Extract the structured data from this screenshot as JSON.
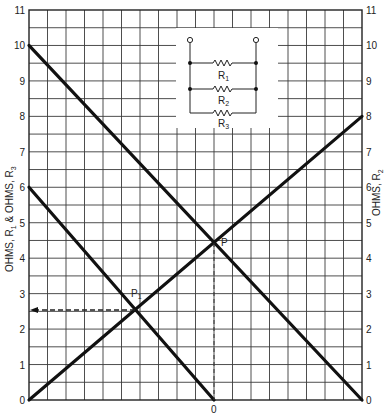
{
  "chart_data": {
    "type": "line",
    "title": "",
    "xlabel": "",
    "ylabel_left": "OHMS, R1 & OHMS, R3",
    "ylabel_right": "OHMS, R2",
    "left_axis": {
      "min": 0,
      "max": 11,
      "ticks": [
        0,
        1,
        2,
        3,
        4,
        5,
        6,
        7,
        8,
        9,
        10,
        11
      ]
    },
    "right_axis": {
      "min": 0,
      "max": 11,
      "ticks": [
        0,
        1,
        2,
        3,
        4,
        5,
        6,
        7,
        8,
        9,
        10,
        11
      ]
    },
    "x_columns": 18,
    "x_marker_label": "0",
    "x_marker_column": 10,
    "grid": true,
    "series": [
      {
        "name": "R1 line",
        "points": [
          [
            0,
            10
          ],
          [
            18,
            0
          ]
        ]
      },
      {
        "name": "R2 line",
        "points": [
          [
            0,
            0
          ],
          [
            18,
            8
          ]
        ]
      },
      {
        "name": "R3 line",
        "points": [
          [
            0,
            6
          ],
          [
            10,
            0
          ]
        ]
      }
    ],
    "annotations": [
      {
        "label": "P",
        "column": 10,
        "value": 4.44,
        "note": "intersection of R1 and R2 lines; dashed vertical drop to 0"
      },
      {
        "label": "P1",
        "column": 5.74,
        "value": 2.55,
        "note": "intersection of R2 and R3 lines; dashed arrow to left axis"
      }
    ],
    "inset": {
      "type": "circuit",
      "description": "Parallel resistors between two terminals",
      "resistors": [
        "R1",
        "R2",
        "R3"
      ]
    }
  },
  "labels": {
    "left_axis_title_main": "OHMS, R",
    "left_axis_title_sub1": "1",
    "left_axis_title_mid": " & OHMS, R",
    "left_axis_title_sub3": "3",
    "right_axis_title_main": "OHMS, R",
    "right_axis_title_sub": "2",
    "point_p": "P",
    "point_p1_main": "P",
    "point_p1_sub": "1",
    "bottom_zero": "0",
    "r1_main": "R",
    "r1_sub": "1",
    "r2_main": "R",
    "r2_sub": "2",
    "r3_main": "R",
    "r3_sub": "3"
  },
  "ticks": {
    "left": [
      "0",
      "1",
      "2",
      "3",
      "4",
      "5",
      "6",
      "7",
      "8",
      "9",
      "10",
      "11"
    ],
    "right": [
      "0",
      "1",
      "2",
      "3",
      "4",
      "5",
      "6",
      "7",
      "8",
      "9",
      "10",
      "11"
    ]
  },
  "colors": {
    "line": "#111111",
    "grid": "#333333",
    "background": "#ffffff"
  }
}
